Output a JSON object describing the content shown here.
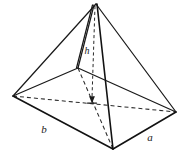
{
  "figure": {
    "name": "pyramid-diagram",
    "type": "geometric-solid",
    "solid": "rectangular-pyramid",
    "background_color": "#ffffff",
    "line_color": "#1a1a1a",
    "labels": {
      "height": "h",
      "base_edge_left": "b",
      "base_edge_right": "a"
    },
    "label_positions": {
      "height": {
        "x": 87,
        "y": 54
      },
      "base_edge_left": {
        "x": 44,
        "y": 133
      },
      "base_edge_right": {
        "x": 150,
        "y": 141
      }
    },
    "vertices": {
      "apex": {
        "x": 96,
        "y": 4
      },
      "base_left": {
        "x": 13,
        "y": 96
      },
      "base_back": {
        "x": 78,
        "y": 68
      },
      "base_right": {
        "x": 176,
        "y": 112
      },
      "base_front": {
        "x": 113,
        "y": 149
      },
      "base_center": {
        "x": 92,
        "y": 102
      }
    },
    "edges_visible": [
      {
        "name": "apex-to-base-left",
        "from": "apex",
        "to": "base_left"
      },
      {
        "name": "apex-to-base-right",
        "from": "apex",
        "to": "base_right"
      },
      {
        "name": "apex-to-base-front",
        "from": "apex",
        "to": "base_front"
      },
      {
        "name": "apex-to-base-back",
        "from": "apex",
        "to": "base_back"
      },
      {
        "name": "base-left-to-front",
        "from": "base_left",
        "to": "base_front"
      },
      {
        "name": "base-front-to-right",
        "from": "base_front",
        "to": "base_right"
      },
      {
        "name": "base-left-to-back",
        "from": "base_left",
        "to": "base_back"
      },
      {
        "name": "base-back-to-right",
        "from": "base_back",
        "to": "base_right"
      }
    ],
    "edges_hidden": [
      {
        "name": "base-diagonal-left-right",
        "from": "base_left",
        "to": "base_right"
      },
      {
        "name": "base-diagonal-back-front",
        "from": "base_back",
        "to": "base_front"
      }
    ],
    "height_segment": {
      "name": "apex-to-base-center",
      "from": "apex",
      "to": "base_center",
      "style": "dashed-with-arrowhead",
      "arrow_at": "base_center"
    }
  }
}
